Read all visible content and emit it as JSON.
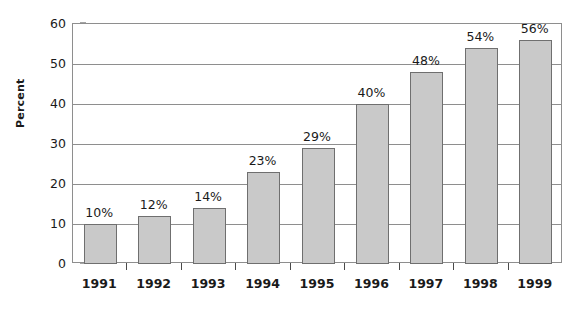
{
  "chart_data": {
    "type": "bar",
    "title": "",
    "xlabel": "",
    "ylabel": "Percent",
    "categories": [
      "1991",
      "1992",
      "1993",
      "1994",
      "1995",
      "1996",
      "1997",
      "1998",
      "1999"
    ],
    "values": [
      10,
      12,
      14,
      23,
      29,
      40,
      48,
      54,
      56
    ],
    "data_labels": [
      "10%",
      "12%",
      "14%",
      "23%",
      "29%",
      "40%",
      "48%",
      "54%",
      "56%"
    ],
    "ylim": [
      0,
      60
    ],
    "y_ticks": [
      0,
      10,
      20,
      30,
      40,
      50,
      60
    ],
    "y_tick_labels": [
      "0",
      "10",
      "20",
      "30",
      "40",
      "50",
      "60"
    ],
    "grid": true,
    "legend": false,
    "colors": {
      "bar_fill": "#c9c9c9",
      "bar_stroke": "#6f6f6f",
      "gridline": "#8e8e8e",
      "axis": "#4a4a4a",
      "text": "#1a1a1a",
      "background": "#ffffff"
    }
  }
}
